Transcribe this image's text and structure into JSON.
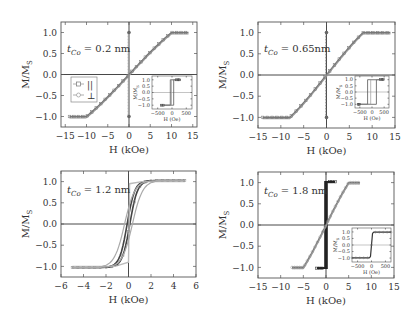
{
  "figure": {
    "ylabel": "M/M",
    "ylabel_sub": "S",
    "xlabel": "H (kOe)",
    "legend": {
      "items": [
        {
          "symbol": "square",
          "label": "||"
        },
        {
          "symbol": "circle",
          "label": "⊥"
        }
      ]
    },
    "colors": {
      "frame": "#555555",
      "parallel": "#777777",
      "perp": "#999999",
      "dark": "#222222",
      "text": "#333333"
    }
  },
  "chart_data": [
    {
      "type": "line",
      "panel": "top-left",
      "annotation": "t_Co = 0.2 nm",
      "annotation_main": "t",
      "annotation_sub": "Co",
      "annotation_rest": " = 0.2 nm",
      "xlabel": "H (kOe)",
      "ylabel": "M/M_S",
      "xlim": [
        -16,
        16
      ],
      "ylim": [
        -1.25,
        1.25
      ],
      "xticks": [
        -15,
        -10,
        -5,
        0,
        5,
        10,
        15
      ],
      "xticklabels": [
        "−15",
        "−10",
        "−5",
        "0",
        "5",
        "10",
        "15"
      ],
      "yticks": [
        -1.0,
        -0.5,
        0.0,
        0.5,
        1.0
      ],
      "yticklabels": [
        "−1.0",
        "−0.5",
        "0.0",
        "0.5",
        "1.0"
      ],
      "legend": [
        "||",
        "⊥"
      ],
      "series": [
        {
          "name": "||",
          "kind": "hard-axis",
          "sat_field": 10,
          "x_range": [
            -14,
            14
          ]
        },
        {
          "name": "⊥",
          "kind": "square",
          "coercive": 0.05,
          "x_range": [
            0,
            0
          ]
        }
      ],
      "inset": {
        "xlim": [
          -700,
          700
        ],
        "ylim": [
          -1.3,
          1.3
        ],
        "xticks": [
          -500,
          0,
          500
        ],
        "xticklabels": [
          "−500",
          "0",
          "500"
        ],
        "yticks": [
          -1.0,
          -0.5,
          0.0,
          0.5,
          1.0
        ],
        "yticklabels": [
          "−1.0",
          "−0.5",
          "0.0",
          "0.5",
          "1.0"
        ],
        "xlabel": "H (Oe)",
        "ylabel": "M/M_S",
        "series": [
          {
            "name": "⊥",
            "kind": "square",
            "coercive": 60,
            "x_range": [
              -400,
              300
            ]
          }
        ]
      }
    },
    {
      "type": "line",
      "panel": "top-right",
      "annotation": "t_Co = 0.65nm",
      "annotation_main": "t",
      "annotation_sub": "Co",
      "annotation_rest": " = 0.65nm",
      "xlabel": "H (kOe)",
      "ylabel": "M/M_S",
      "xlim": [
        -15,
        15
      ],
      "ylim": [
        -1.25,
        1.25
      ],
      "xticks": [
        -15,
        -10,
        -5,
        0,
        5,
        10,
        15
      ],
      "xticklabels": [
        "−15",
        "−10",
        "−5",
        "0",
        "5",
        "10",
        "15"
      ],
      "yticks": [
        -1.0,
        -0.5,
        0.0,
        0.5,
        1.0
      ],
      "yticklabels": [
        "−1.0",
        "−0.5",
        "0.0",
        "0.5",
        "1.0"
      ],
      "series": [
        {
          "name": "||",
          "kind": "hard-axis",
          "sat_field": 8,
          "x_range": [
            -14,
            14
          ]
        },
        {
          "name": "⊥",
          "kind": "square",
          "coercive": 0.1,
          "x_range": [
            0,
            0
          ]
        }
      ],
      "inset": {
        "xlim": [
          -700,
          700
        ],
        "ylim": [
          -1.3,
          1.3
        ],
        "xticks": [
          -500,
          0,
          500
        ],
        "xticklabels": [
          "−500",
          "0",
          "500"
        ],
        "yticks": [
          -1.0,
          -0.5,
          0.0,
          0.5,
          1.0
        ],
        "yticklabels": [
          "−1.0",
          "−0.5",
          "0.0",
          "0.5",
          "1.0"
        ],
        "xlabel": "H (Oe)",
        "ylabel": "M/M_S",
        "series": [
          {
            "name": "⊥",
            "kind": "square",
            "coercive": 180,
            "x_range": [
              -600,
              500
            ]
          }
        ]
      }
    },
    {
      "type": "line",
      "panel": "bottom-left",
      "annotation": "t_Co = 1.2 nm",
      "annotation_main": "t",
      "annotation_sub": "Co",
      "annotation_rest": " = 1.2 nm",
      "xlabel": "H (kOe)",
      "ylabel": "M/M_S",
      "xlim": [
        -6,
        6
      ],
      "ylim": [
        -1.25,
        1.25
      ],
      "xticks": [
        -6,
        -4,
        -2,
        0,
        2,
        4,
        6
      ],
      "xticklabels": [
        "−6",
        "−4",
        "−2",
        "0",
        "2",
        "4",
        "6"
      ],
      "yticks": [
        -1.0,
        -0.5,
        0.0,
        0.5,
        1.0
      ],
      "yticklabels": [
        "−1.0",
        "−0.5",
        "0.0",
        "0.5",
        "1.0"
      ],
      "series": [
        {
          "name": "||",
          "kind": "soft",
          "sat_field": 1.5,
          "x_range": [
            -5,
            5
          ]
        },
        {
          "name": "⊥",
          "kind": "soft-hyst",
          "sat_field": 2,
          "x_range": [
            -5,
            5
          ]
        }
      ]
    },
    {
      "type": "line",
      "panel": "bottom-right",
      "annotation": "t_Co = 1.8 nm",
      "annotation_main": "t",
      "annotation_sub": "Co",
      "annotation_rest": " = 1.8 nm",
      "xlabel": "H (kOe)",
      "ylabel": "M/M_S",
      "xlim": [
        -15,
        15
      ],
      "ylim": [
        -1.25,
        1.25
      ],
      "xticks": [
        -15,
        -10,
        -5,
        0,
        5,
        10,
        15
      ],
      "xticklabels": [
        "−15",
        "−10",
        "−5",
        "0",
        "5",
        "10",
        "15"
      ],
      "yticks": [
        -1.0,
        -0.5,
        0.0,
        0.5,
        1.0
      ],
      "yticklabels": [
        "−1.0",
        "−0.5",
        "0.0",
        "0.5",
        "1.0"
      ],
      "series": [
        {
          "name": "||",
          "kind": "square-dark",
          "coercive": 0.2,
          "x_range": [
            -2,
            2
          ]
        },
        {
          "name": "⊥",
          "kind": "hard-axis",
          "sat_field": 5,
          "x_range": [
            -7.5,
            7.5
          ]
        }
      ],
      "inset": {
        "xlim": [
          -700,
          700
        ],
        "ylim": [
          -1.3,
          1.3
        ],
        "xticks": [
          -500,
          0,
          500
        ],
        "xticklabels": [
          "−500",
          "0",
          "500"
        ],
        "yticks": [
          -1.0,
          -0.5,
          0.0,
          0.5,
          1.0
        ],
        "yticklabels": [
          "−1.0",
          "−0.5",
          "0.0",
          "0.5",
          "1.0"
        ],
        "xlabel": "H (Oe)",
        "ylabel": "M/M_S",
        "series": [
          {
            "name": "||",
            "kind": "steep",
            "coercive": 10,
            "x_range": [
              -700,
              700
            ]
          }
        ]
      }
    }
  ]
}
